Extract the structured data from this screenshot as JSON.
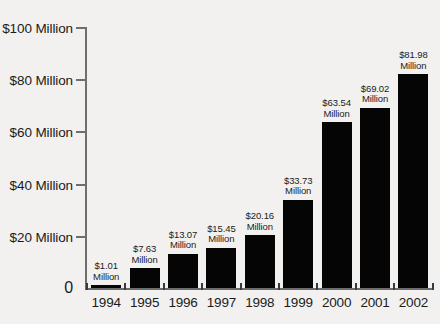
{
  "chart_data": {
    "type": "bar",
    "title": "",
    "xlabel": "",
    "ylabel": "",
    "categories": [
      "1994",
      "1995",
      "1996",
      "1997",
      "1998",
      "1999",
      "2000",
      "2001",
      "2002"
    ],
    "values": [
      1.01,
      7.63,
      13.07,
      15.45,
      20.16,
      33.73,
      63.54,
      69.02,
      81.98
    ],
    "value_labels": [
      "$1.01 Million",
      "$7.63 Million",
      "$13.07 Million",
      "$15.45 Million",
      "$20.16 Million",
      "$33.73 Million",
      "$63.54 Million",
      "$69.02 Million",
      "$81.98 Million"
    ],
    "value_label_lines": [
      {
        "amount": "$1.01",
        "unit": "Million"
      },
      {
        "amount": "$7.63",
        "unit": "Million"
      },
      {
        "amount": "$13.07",
        "unit": "Million"
      },
      {
        "amount": "$15.45",
        "unit": "Million"
      },
      {
        "amount": "$20.16",
        "unit": "Million"
      },
      {
        "amount": "$33.73",
        "unit": "Million"
      },
      {
        "amount": "$63.54",
        "unit": "Million"
      },
      {
        "amount": "$69.02",
        "unit": "Million"
      },
      {
        "amount": "$81.98",
        "unit": "Million"
      }
    ],
    "unit": "Million",
    "currency": "$",
    "ylim": [
      0,
      100
    ],
    "yticks": [
      0,
      20,
      40,
      60,
      80,
      100
    ],
    "ytick_labels": [
      "0",
      "$20 Million",
      "$40 Million",
      "$60 Million",
      "$80 Million",
      "$100 Million"
    ],
    "grid": false,
    "legend": null,
    "colors": {
      "bar": "#050505",
      "axis": "#6e6e6e",
      "text": "#1b1b1b",
      "background": "#f2f1ef"
    }
  }
}
